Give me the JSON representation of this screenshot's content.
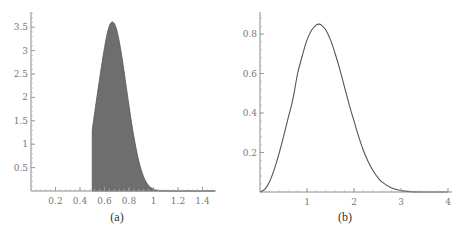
{
  "chart_data": [
    {
      "id": "a",
      "type": "area",
      "caption": "(a)",
      "title": "",
      "xlabel": "",
      "ylabel": "",
      "xlim": [
        0,
        1.5
      ],
      "ylim": [
        0,
        3.8
      ],
      "grid": false,
      "legend": null,
      "xticks": [
        0.2,
        0.4,
        0.6,
        0.8,
        1,
        1.2,
        1.4
      ],
      "xtick_labels": [
        "0.2",
        "0.4",
        "0.6",
        "0.8",
        "1",
        "1.2",
        "1.4"
      ],
      "yticks": [
        0.5,
        1,
        1.5,
        2,
        2.5,
        3,
        3.5
      ],
      "ytick_labels": [
        "0.5",
        "1",
        "1.5",
        "2",
        "2.5",
        "3",
        "3.5"
      ],
      "fill_color": "#6e6e6e",
      "series": [
        {
          "name": "density (truncated at x=0.5, shaded)",
          "x": [
            0.5,
            0.52,
            0.55,
            0.58,
            0.6,
            0.62,
            0.64,
            0.66,
            0.68,
            0.7,
            0.72,
            0.74,
            0.76,
            0.78,
            0.8,
            0.82,
            0.84,
            0.86,
            0.88,
            0.9,
            0.92,
            0.94,
            0.96,
            0.98,
            1.0,
            1.02,
            1.05,
            1.08,
            1.12,
            1.2,
            1.5
          ],
          "y": [
            1.3,
            1.68,
            2.22,
            2.74,
            3.06,
            3.34,
            3.53,
            3.61,
            3.58,
            3.44,
            3.2,
            2.9,
            2.55,
            2.18,
            1.82,
            1.47,
            1.16,
            0.88,
            0.64,
            0.45,
            0.3,
            0.19,
            0.12,
            0.07,
            0.04,
            0.02,
            0.008,
            0.003,
            0.001,
            0.0,
            0.0
          ]
        }
      ]
    },
    {
      "id": "b",
      "type": "line",
      "caption": "(b)",
      "title": "",
      "xlabel": "",
      "ylabel": "",
      "xlim": [
        0,
        4.1
      ],
      "ylim": [
        0,
        0.9
      ],
      "grid": false,
      "legend": null,
      "xticks": [
        1,
        2,
        3,
        4
      ],
      "xtick_labels": [
        "1",
        "2",
        "3",
        "4"
      ],
      "yticks": [
        0.2,
        0.4,
        0.6,
        0.8
      ],
      "ytick_labels": [
        "0.2",
        "0.4",
        "0.6",
        "0.8"
      ],
      "series": [
        {
          "name": "density",
          "x": [
            0,
            0.1,
            0.2,
            0.3,
            0.4,
            0.5,
            0.6,
            0.7,
            0.8,
            0.9,
            1.0,
            1.1,
            1.2,
            1.25,
            1.3,
            1.4,
            1.5,
            1.6,
            1.7,
            1.8,
            1.9,
            2.0,
            2.1,
            2.2,
            2.3,
            2.4,
            2.5,
            2.6,
            2.8,
            3.0,
            3.2,
            3.5,
            4.0
          ],
          "y": [
            0,
            0.013,
            0.051,
            0.112,
            0.19,
            0.28,
            0.375,
            0.47,
            0.6,
            0.69,
            0.77,
            0.82,
            0.846,
            0.85,
            0.846,
            0.82,
            0.77,
            0.7,
            0.62,
            0.53,
            0.44,
            0.36,
            0.28,
            0.21,
            0.155,
            0.11,
            0.075,
            0.05,
            0.02,
            0.007,
            0.002,
            0.0,
            0.0
          ]
        }
      ]
    }
  ],
  "layout": {
    "a": {
      "x0": 31,
      "x1": 216,
      "y0": 191,
      "ytop": 12,
      "px_per_x": 122.5,
      "px_per_y": 46.8,
      "caption_x": 117,
      "caption_y": 221
    },
    "b": {
      "x0": 260,
      "x1": 452,
      "y0": 192,
      "ytop": 12,
      "px_per_x": 47,
      "px_per_y": 197.5,
      "caption_x": 345,
      "caption_y": 221
    }
  }
}
